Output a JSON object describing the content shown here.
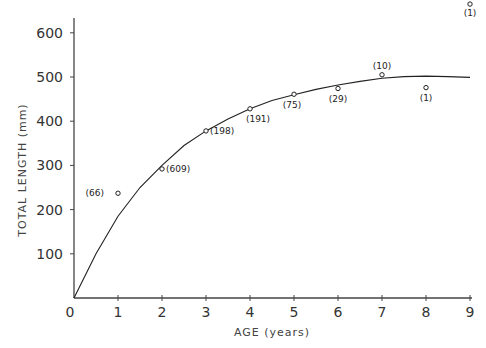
{
  "chart_data": {
    "type": "scatter",
    "title": "",
    "xlabel": "AGE (years)",
    "ylabel": "TOTAL LENGTH (mm)",
    "xlim": [
      0,
      9
    ],
    "ylim": [
      0,
      650
    ],
    "grid": false,
    "x_ticks": [
      "0",
      "1",
      "2",
      "3",
      "4",
      "5",
      "6",
      "7",
      "8",
      "9"
    ],
    "y_ticks": [
      "100",
      "200",
      "300",
      "400",
      "500",
      "600"
    ],
    "series": [
      {
        "name": "observed mean length",
        "marker": "open-circle",
        "points": [
          {
            "x": 1,
            "y": 237,
            "n": "(66)"
          },
          {
            "x": 2,
            "y": 292,
            "n": "(609)"
          },
          {
            "x": 3,
            "y": 378,
            "n": "(198)"
          },
          {
            "x": 4,
            "y": 428,
            "n": "(191)"
          },
          {
            "x": 5,
            "y": 461,
            "n": "(75)"
          },
          {
            "x": 6,
            "y": 474,
            "n": "(29)"
          },
          {
            "x": 7,
            "y": 505,
            "n": "(10)"
          },
          {
            "x": 8,
            "y": 476,
            "n": "(1)"
          },
          {
            "x": 9,
            "y": 665,
            "n": "(1)"
          }
        ]
      },
      {
        "name": "fitted growth curve",
        "type": "line",
        "x": [
          0,
          0.5,
          1,
          1.5,
          2,
          2.5,
          3,
          3.5,
          4,
          4.5,
          5,
          5.5,
          6,
          6.5,
          7,
          7.5,
          8,
          8.5,
          9
        ],
        "values": [
          0,
          100,
          185,
          250,
          300,
          345,
          378,
          405,
          428,
          447,
          460,
          472,
          482,
          490,
          497,
          501,
          502,
          501,
          499
        ]
      }
    ]
  },
  "axes": {
    "x_title": "AGE (years)",
    "y_title": "TOTAL LENGTH (mm)"
  }
}
